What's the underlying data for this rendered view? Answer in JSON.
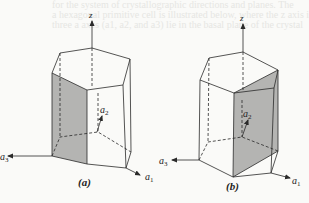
{
  "figure": {
    "panels": [
      {
        "id": "a",
        "caption": "(a)",
        "axes": {
          "z": "z",
          "a1": "a",
          "a1_sub": "1",
          "a2": "a",
          "a2_sub": "2",
          "a3": "a",
          "a3_sub": "3"
        },
        "shaded_face": "left rectangular prism face (plane through a3 origin, vertical)",
        "shade_color": "#b4b4b2"
      },
      {
        "id": "b",
        "caption": "(b)",
        "axes": {
          "z": "z",
          "a1": "a",
          "a1_sub": "1",
          "a2": "a",
          "a2_sub": "2",
          "a3": "a",
          "a3_sub": "3"
        },
        "shaded_face": "vertical plane from front-bottom vertex to right side",
        "shade_color": "#b4b4b2"
      }
    ],
    "line_color": "#2a2a2a"
  },
  "bleed_text": [
    "for the system of crystallographic directions and planes. The",
    "a hexagonal primitive cell is illustrated below, where the z axis is",
    "three a axes (a1, a2, and a3) lie in the basal plane of the crystal"
  ]
}
